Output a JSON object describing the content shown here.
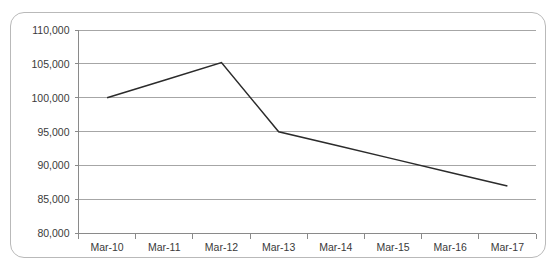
{
  "chart_data": {
    "type": "line",
    "title": "",
    "subtitle": "",
    "xlabel": "",
    "ylabel": "",
    "categories": [
      "Mar-10",
      "Mar-11",
      "Mar-12",
      "Mar-13",
      "Mar-14",
      "Mar-15",
      "Mar-16",
      "Mar-17"
    ],
    "series": [
      {
        "name": "",
        "values": [
          100000,
          102600,
          105200,
          95000,
          93000,
          91000,
          89000,
          87000
        ],
        "color": "#2b2b2b"
      }
    ],
    "ylim": [
      80000,
      110000
    ],
    "ytick_values": [
      80000,
      85000,
      90000,
      95000,
      100000,
      105000,
      110000
    ],
    "ytick_labels": [
      "80,000",
      "85,000",
      "90,000",
      "95,000",
      "100,000",
      "105,000",
      "110,000"
    ],
    "xtick_labels": [
      "Mar-10",
      "Mar-11",
      "Mar-12",
      "Mar-13",
      "Mar-14",
      "Mar-15",
      "Mar-16",
      "Mar-17"
    ],
    "grid": true,
    "grid_axis": "y",
    "legend": false,
    "legend_position": "none",
    "markers": false,
    "gridline_color": "#a6a6a6",
    "axis_color": "#8a8a8a",
    "border_color": "#b9b9b9",
    "background_color": "#ffffff"
  }
}
